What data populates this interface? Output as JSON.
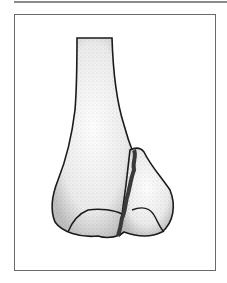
{
  "figure": {
    "colors": {
      "frame_border": "#6a6a6a",
      "top_rule": "#8a8a8a",
      "outline": "#1a1a1a",
      "bone_fill": "#f2f2f2",
      "stipple": "#555555",
      "fracture": "#444444"
    }
  }
}
